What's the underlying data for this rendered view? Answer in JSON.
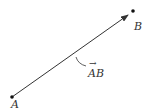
{
  "diagram": {
    "type": "vector",
    "points": [
      {
        "label": "A",
        "x": 12,
        "y": 97
      },
      {
        "label": "B",
        "x": 133,
        "y": 11
      }
    ],
    "vector_label": "AB",
    "vector_label_arrow": "→",
    "colors": {
      "line": "#333333",
      "point": "#111111"
    }
  }
}
